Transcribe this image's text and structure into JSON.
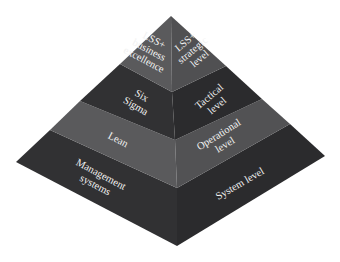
{
  "diagram": {
    "type": "stepped-pyramid",
    "colors": {
      "layer_light_left": "#5a5a5c",
      "layer_light_right": "#505052",
      "layer_dark_left": "#313133",
      "layer_dark_right": "#2b2b2d",
      "text": "#f2f2f2",
      "background": "#ffffff"
    },
    "layers": [
      {
        "name": "top",
        "left_label": [
          "LSS+",
          "business",
          "excellence"
        ],
        "right_label": [
          "LSS+",
          "strategic",
          "level"
        ]
      },
      {
        "name": "six-sigma",
        "left_label": [
          "Six",
          "Sigma"
        ],
        "right_label": [
          "Tactical",
          "level"
        ]
      },
      {
        "name": "lean",
        "left_label": [
          "Lean"
        ],
        "right_label": [
          "Operational",
          "level"
        ]
      },
      {
        "name": "management",
        "left_label": [
          "Management",
          "systems"
        ],
        "right_label": [
          "System level"
        ]
      }
    ]
  }
}
